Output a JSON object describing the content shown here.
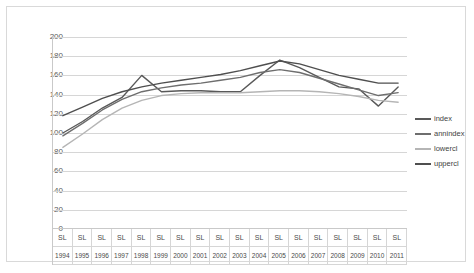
{
  "chart_data": {
    "type": "line",
    "title": "",
    "xlabel": "",
    "ylabel": "",
    "ylim": [
      0,
      200
    ],
    "yticks": [
      0,
      20,
      40,
      60,
      80,
      100,
      120,
      140,
      160,
      180,
      200
    ],
    "grid": true,
    "legend_position": "right",
    "categories": [
      "1994",
      "1995",
      "1996",
      "1997",
      "1998",
      "1999",
      "2000",
      "2001",
      "2002",
      "2003",
      "2004",
      "2005",
      "2006",
      "2007",
      "2008",
      "2009",
      "2010",
      "2011"
    ],
    "category_prefix_labels": [
      "SL",
      "SL",
      "SL",
      "SL",
      "SL",
      "SL",
      "SL",
      "SL",
      "SL",
      "SL",
      "SL",
      "SL",
      "SL",
      "SL",
      "SL",
      "SL",
      "SL",
      "SL"
    ],
    "series": [
      {
        "name": "index",
        "color": "#595959",
        "values": [
          100,
          112,
          126,
          137,
          160,
          143,
          144,
          144,
          143,
          143,
          160,
          176,
          168,
          158,
          148,
          146,
          128,
          148
        ]
      },
      {
        "name": "annindex",
        "color": "#6e6e6e",
        "values": [
          97,
          110,
          124,
          135,
          143,
          147,
          150,
          152,
          155,
          158,
          163,
          166,
          163,
          157,
          151,
          145,
          139,
          142
        ]
      },
      {
        "name": "lowercl",
        "color": "#b5b5b5",
        "values": [
          85,
          99,
          114,
          126,
          134,
          139,
          141,
          142,
          142,
          142,
          143,
          144,
          144,
          143,
          141,
          138,
          134,
          132
        ]
      },
      {
        "name": "uppercl",
        "color": "#4f4f4f",
        "values": [
          118,
          127,
          136,
          143,
          148,
          152,
          155,
          158,
          161,
          165,
          170,
          175,
          172,
          166,
          160,
          156,
          152,
          152
        ]
      }
    ]
  },
  "legend": {
    "items": [
      {
        "label": "index",
        "color": "#595959"
      },
      {
        "label": "annindex",
        "color": "#6e6e6e"
      },
      {
        "label": "lowercl",
        "color": "#b5b5b5"
      },
      {
        "label": "uppercl",
        "color": "#4f4f4f"
      }
    ]
  }
}
